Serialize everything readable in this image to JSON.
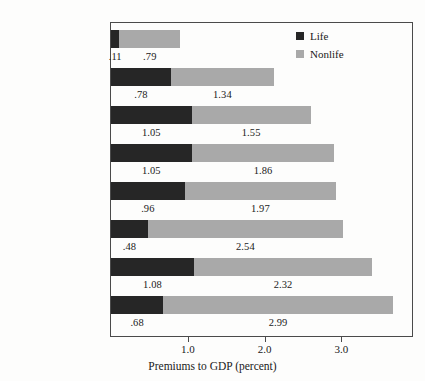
{
  "chart_data": {
    "type": "bar",
    "orientation": "horizontal",
    "stacked": true,
    "title": "",
    "xlabel": "Premiums to GDP (percent)",
    "ylabel": "",
    "xlim": [
      0,
      3.93
    ],
    "xticks": [
      1.0,
      2.0,
      3.0
    ],
    "xtick_labels": [
      "1.0",
      "2.0",
      "3.0"
    ],
    "grid": false,
    "legend_position": "top-right",
    "categories": [
      "Romania (75)",
      "Russia (49)",
      "Hungary (44)",
      "Slovakia (40)",
      "Poland (39)",
      "Croatia (38)",
      "Czech Republic (35)",
      "Slovenia (33)"
    ],
    "series": [
      {
        "name": "Life",
        "color": "#262626",
        "values": [
          0.11,
          0.78,
          1.05,
          1.05,
          0.96,
          0.48,
          1.08,
          0.68
        ],
        "labels": [
          ".11",
          ".78",
          "1.05",
          "1.05",
          ".96",
          ".48",
          "1.08",
          ".68"
        ]
      },
      {
        "name": "Nonlife",
        "color": "#a9a9a9",
        "values": [
          0.79,
          1.34,
          1.55,
          1.86,
          1.97,
          2.54,
          2.32,
          2.99
        ],
        "labels": [
          ".79",
          "1.34",
          "1.55",
          "1.86",
          "1.97",
          "2.54",
          "2.32",
          "2.99"
        ]
      }
    ],
    "totals": [
      0.9,
      2.12,
      2.6,
      2.91,
      2.93,
      3.02,
      3.4,
      3.67
    ]
  },
  "legend": {
    "items": [
      {
        "label": "Life",
        "color": "#262626"
      },
      {
        "label": "Nonlife",
        "color": "#a9a9a9"
      }
    ]
  },
  "axis": {
    "title": "Premiums to GDP (percent)"
  }
}
